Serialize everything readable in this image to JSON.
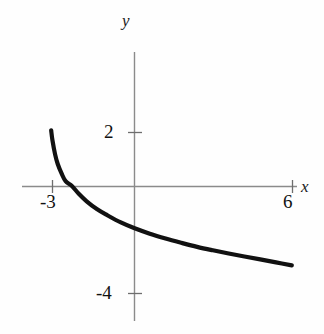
{
  "figure": {
    "background_color": "#fefefe",
    "curve_color": "#111111",
    "axis_color": "#8b8b8b",
    "text_color": "#111111",
    "top_bleed_text": ""
  },
  "labels": {
    "y_axis": "y",
    "x_axis": "x",
    "tick_y_2": "2",
    "tick_y_neg4": "-4",
    "tick_x_neg3": "-3",
    "tick_x_6": "6"
  },
  "chart_data": {
    "type": "line",
    "title": "",
    "subtitle": "",
    "xlabel": "x",
    "ylabel": "y",
    "xlim": [
      -4.2,
      7.2
    ],
    "ylim": [
      -5.0,
      4.9
    ],
    "grid": false,
    "legend": null,
    "x_ticks": [
      -3,
      6
    ],
    "x_tick_labels": [
      "-3",
      "6"
    ],
    "y_ticks": [
      2,
      -4
    ],
    "y_tick_labels": [
      "2",
      "-4"
    ],
    "axes_style": "two-crossed-arrowless-axes-with-end-ticks",
    "annotations": [
      {
        "text": "y",
        "role": "y-axis-label",
        "position": "above y-axis top"
      },
      {
        "text": "x",
        "role": "x-axis-label",
        "position": "right of x-axis end"
      }
    ],
    "series": [
      {
        "name": "decreasing logarithmic curve",
        "description": "Decreasing curve with vertical asymptote just left of x = -3; passes downward through the x-axis near x = -2.4 and ends near (6, -4).",
        "asymptote_x": -3.2,
        "x_root": -2.36,
        "x": [
          -3.15,
          -3.1,
          -3.0,
          -2.9,
          -2.75,
          -2.6,
          -2.36,
          -2.1,
          -1.8,
          -1.4,
          -1.0,
          -0.5,
          0.0,
          0.6,
          1.2,
          1.8,
          2.4,
          3.0,
          3.6,
          4.2,
          4.8,
          5.4,
          6.0
        ],
        "y": [
          2.08,
          1.7,
          1.18,
          0.82,
          0.46,
          0.18,
          0.0,
          -0.29,
          -0.57,
          -0.87,
          -1.1,
          -1.36,
          -1.57,
          -1.78,
          -1.96,
          -2.12,
          -2.27,
          -2.4,
          -2.52,
          -2.63,
          -2.74,
          -2.85,
          -2.96
        ]
      }
    ]
  },
  "geometry": {
    "origin_px": {
      "x": 134,
      "y": 186
    },
    "x_unit_px": 26.3,
    "y_unit_px": 26.8,
    "x_axis_px": {
      "x1": 22,
      "x2": 297
    },
    "y_axis_px": {
      "y1": 52,
      "y2": 321
    }
  }
}
